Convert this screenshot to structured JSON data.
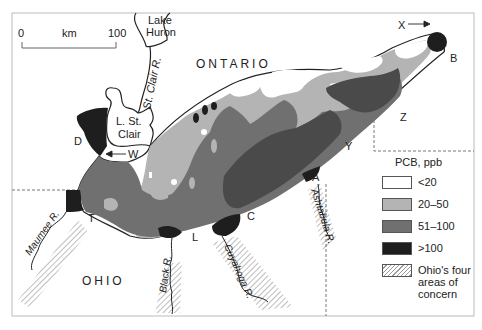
{
  "map": {
    "title_region_labels": {
      "ontario": "ONTARIO",
      "ohio": "OHIO",
      "lake_huron_line1": "Lake",
      "lake_huron_line2": "Huron",
      "lake_st_clair_line1": "L. St.",
      "lake_st_clair_line2": "Clair",
      "st_clair_river": "St. Clair R."
    },
    "scale_bar": {
      "start": "0",
      "unit": "km",
      "end": "100"
    },
    "rivers": {
      "maumee": "Maumee R.",
      "black": "Black R.",
      "cuyahoga": "Cuyahoga R.",
      "ashtabula": "Ashtabula R."
    },
    "point_labels": {
      "X": "X",
      "B": "B",
      "Z": "Z",
      "Y": "Y",
      "A": "A",
      "C": "C",
      "L": "L",
      "T": "T",
      "D": "D",
      "W": "W"
    }
  },
  "legend": {
    "title": "PCB, ppb",
    "items": [
      {
        "label": "<20",
        "color": "#ffffff"
      },
      {
        "label": "20–50",
        "color": "#b4b4b4"
      },
      {
        "label": "51–100",
        "color": "#707070"
      },
      {
        "label": ">100",
        "color": "#1e1e1e"
      },
      {
        "label": "Ohio's four areas of concern",
        "color": "hatched"
      }
    ]
  },
  "colors": {
    "lt20": "#ffffff",
    "c20_50": "#b4b4b4",
    "c51_100": "#707070",
    "gt100": "#1e1e1e",
    "hatch": "#9a9a9a"
  }
}
